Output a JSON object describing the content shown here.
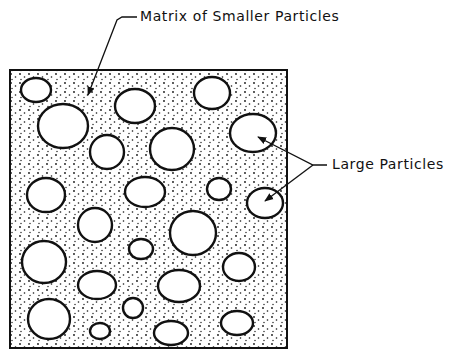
{
  "diagram": {
    "labels": {
      "matrix": "Matrix of Smaller Particles",
      "large": "Large Particles"
    },
    "colors": {
      "ink": "#111111",
      "background": "#ffffff"
    },
    "box": {
      "x": 10,
      "y": 70,
      "width": 277,
      "height": 278
    },
    "large_particles": [
      {
        "cx": 36,
        "cy": 90,
        "rx": 15,
        "ry": 12
      },
      {
        "cx": 63,
        "cy": 126,
        "rx": 25,
        "ry": 22
      },
      {
        "cx": 135,
        "cy": 106,
        "rx": 20,
        "ry": 17
      },
      {
        "cx": 212,
        "cy": 93,
        "rx": 18,
        "ry": 16
      },
      {
        "cx": 253,
        "cy": 133,
        "rx": 23,
        "ry": 19
      },
      {
        "cx": 107,
        "cy": 152,
        "rx": 17,
        "ry": 17
      },
      {
        "cx": 172,
        "cy": 149,
        "rx": 22,
        "ry": 21
      },
      {
        "cx": 265,
        "cy": 203,
        "rx": 18,
        "ry": 15
      },
      {
        "cx": 46,
        "cy": 195,
        "rx": 19,
        "ry": 17
      },
      {
        "cx": 145,
        "cy": 192,
        "rx": 20,
        "ry": 15
      },
      {
        "cx": 219,
        "cy": 189,
        "rx": 12,
        "ry": 11
      },
      {
        "cx": 95,
        "cy": 225,
        "rx": 17,
        "ry": 17
      },
      {
        "cx": 193,
        "cy": 233,
        "rx": 23,
        "ry": 22
      },
      {
        "cx": 44,
        "cy": 262,
        "rx": 22,
        "ry": 21
      },
      {
        "cx": 141,
        "cy": 249,
        "rx": 12,
        "ry": 10
      },
      {
        "cx": 239,
        "cy": 267,
        "rx": 16,
        "ry": 14
      },
      {
        "cx": 97,
        "cy": 285,
        "rx": 19,
        "ry": 14
      },
      {
        "cx": 179,
        "cy": 286,
        "rx": 21,
        "ry": 16
      },
      {
        "cx": 49,
        "cy": 319,
        "rx": 21,
        "ry": 20
      },
      {
        "cx": 133,
        "cy": 308,
        "rx": 10,
        "ry": 10
      },
      {
        "cx": 100,
        "cy": 331,
        "rx": 10,
        "ry": 8
      },
      {
        "cx": 171,
        "cy": 333,
        "rx": 17,
        "ry": 12
      },
      {
        "cx": 237,
        "cy": 323,
        "rx": 16,
        "ry": 12
      }
    ]
  }
}
